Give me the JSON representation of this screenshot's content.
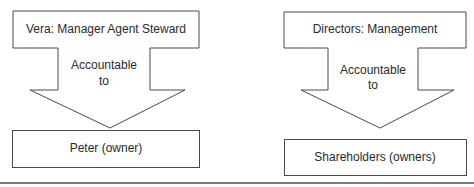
{
  "diagrams": [
    {
      "top_label": "Vera: Manager Agent Steward",
      "arrow_label_line1": "Accountable",
      "arrow_label_line2": "to",
      "bottom_label": "Peter (owner)"
    },
    {
      "top_label": "Directors: Management",
      "arrow_label_line1": "Accountable",
      "arrow_label_line2": "to",
      "bottom_label": "Shareholders (owners)"
    }
  ],
  "colors": {
    "stroke": "#4a4a4a",
    "rule": "#7a7a7a",
    "background": "#ffffff"
  }
}
